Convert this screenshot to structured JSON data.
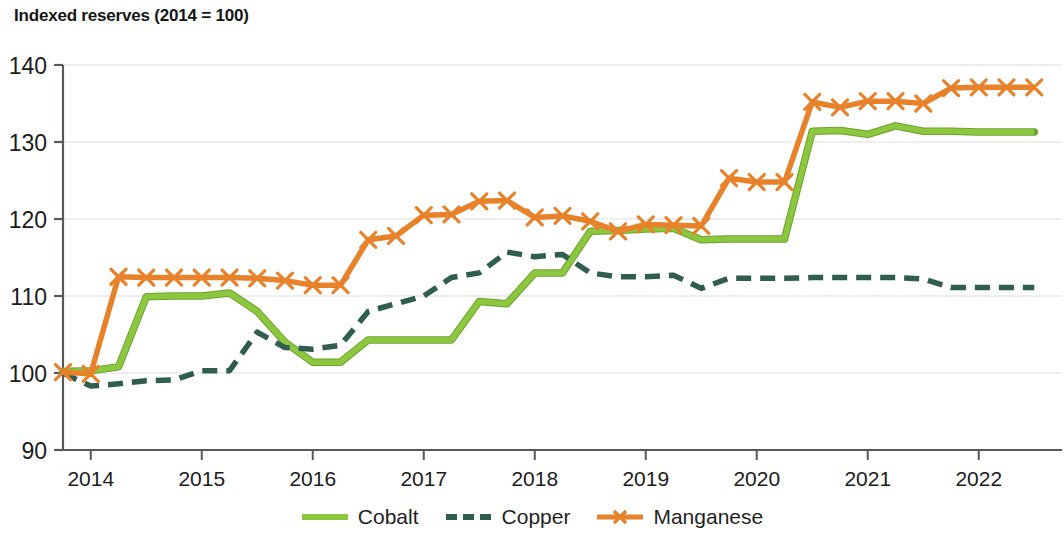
{
  "chart_data": {
    "type": "line",
    "title": "Indexed reserves (2014 = 100)",
    "xlabel": "",
    "ylabel": "",
    "ylim": [
      90,
      140
    ],
    "yticks": [
      90,
      100,
      110,
      120,
      130,
      140
    ],
    "xticks": [
      "2014",
      "2015",
      "2016",
      "2017",
      "2018",
      "2019",
      "2020",
      "2021",
      "2022"
    ],
    "xlim": [
      2013.75,
      2022.75
    ],
    "grid": true,
    "grid_axis": "y",
    "legend_position": "bottom-center",
    "x": [
      2013.75,
      2014.0,
      2014.25,
      2014.5,
      2014.75,
      2015.0,
      2015.25,
      2015.5,
      2015.75,
      2016.0,
      2016.25,
      2016.5,
      2016.75,
      2017.0,
      2017.25,
      2017.5,
      2017.75,
      2018.0,
      2018.25,
      2018.5,
      2018.75,
      2019.0,
      2019.25,
      2019.5,
      2019.75,
      2020.0,
      2020.25,
      2020.5,
      2020.75,
      2021.0,
      2021.25,
      2021.5,
      2021.75,
      2022.0,
      2022.25,
      2022.5
    ],
    "series": [
      {
        "name": "Cobalt",
        "color": "#8DC63F",
        "style": "solid",
        "marker": "none",
        "values": [
          100.2,
          100.3,
          100.8,
          109.9,
          110.0,
          110.0,
          110.4,
          108.0,
          104.0,
          101.4,
          101.4,
          104.3,
          104.3,
          104.3,
          104.3,
          109.3,
          109.0,
          113.0,
          113.0,
          118.4,
          118.5,
          118.7,
          118.8,
          117.3,
          117.4,
          117.4,
          117.4,
          131.4,
          131.5,
          131.0,
          132.1,
          131.4,
          131.4,
          131.3,
          131.3,
          131.3
        ]
      },
      {
        "name": "Copper",
        "color": "#2F5D50",
        "style": "dashed",
        "marker": "none",
        "values": [
          100.0,
          98.3,
          98.6,
          99.0,
          99.1,
          100.3,
          100.3,
          105.3,
          103.3,
          103.1,
          103.6,
          108.0,
          109.0,
          110.0,
          112.4,
          113.0,
          115.7,
          115.1,
          115.4,
          113.0,
          112.5,
          112.5,
          112.7,
          111.0,
          112.3,
          112.3,
          112.3,
          112.4,
          112.4,
          112.4,
          112.4,
          112.2,
          111.1,
          111.1,
          111.1,
          111.1
        ]
      },
      {
        "name": "Manganese",
        "color": "#E8822A",
        "style": "solid",
        "marker": "x",
        "values": [
          100.1,
          99.9,
          112.5,
          112.4,
          112.4,
          112.4,
          112.4,
          112.3,
          112.0,
          111.4,
          111.4,
          117.3,
          117.8,
          120.5,
          120.6,
          122.3,
          122.4,
          120.2,
          120.4,
          119.7,
          118.4,
          119.3,
          119.2,
          119.1,
          125.3,
          124.8,
          124.8,
          135.2,
          134.5,
          135.3,
          135.3,
          135.0,
          137.0,
          137.1,
          137.1,
          137.1
        ]
      }
    ]
  },
  "legend": {
    "items": [
      {
        "label": "Cobalt"
      },
      {
        "label": "Copper"
      },
      {
        "label": "Manganese"
      }
    ]
  },
  "axes": {
    "y_labels": [
      "140",
      "130",
      "120",
      "110",
      "100",
      "90"
    ],
    "x_labels": [
      "2014",
      "2015",
      "2016",
      "2017",
      "2018",
      "2019",
      "2020",
      "2021",
      "2022"
    ]
  }
}
